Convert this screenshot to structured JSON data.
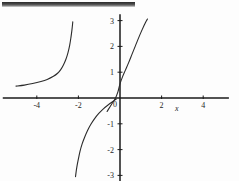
{
  "page": {
    "background_color": "#fdfdfd",
    "top_bar": {
      "label": "scan-artifact-bar",
      "color": "#2a2a2a"
    }
  },
  "chart_data": {
    "type": "line",
    "title": "",
    "subtitle": "",
    "xlabel": "x",
    "ylabel": "",
    "xlim": [
      -5.6,
      5.2
    ],
    "ylim": [
      -3.1,
      3.1
    ],
    "grid": false,
    "legend": null,
    "axis_color": "#1a1a1a",
    "curve_color": "#2b2b2b",
    "xticks": [
      -4,
      -2,
      2,
      4
    ],
    "xtick_labels": [
      "-4",
      "-2",
      "2",
      "4"
    ],
    "yticks": [
      3,
      2,
      1,
      0,
      -1,
      -2,
      -3
    ],
    "ytick_labels": [
      "3",
      "2",
      "1",
      "0",
      "-1",
      "-2",
      "-3"
    ],
    "origin_label": "0",
    "series": [
      {
        "name": "branch-left",
        "points": [
          [
            -5.0,
            0.46
          ],
          [
            -4.6,
            0.5
          ],
          [
            -4.2,
            0.56
          ],
          [
            -3.8,
            0.64
          ],
          [
            -3.5,
            0.72
          ],
          [
            -3.2,
            0.84
          ],
          [
            -3.0,
            0.96
          ],
          [
            -2.85,
            1.1
          ],
          [
            -2.72,
            1.28
          ],
          [
            -2.6,
            1.5
          ],
          [
            -2.5,
            1.76
          ],
          [
            -2.42,
            2.04
          ],
          [
            -2.36,
            2.34
          ],
          [
            -2.31,
            2.64
          ],
          [
            -2.27,
            2.95
          ]
        ]
      },
      {
        "name": "branch-middle",
        "points": [
          [
            -2.14,
            -3.05
          ],
          [
            -2.08,
            -2.7
          ],
          [
            -2.0,
            -2.36
          ],
          [
            -1.92,
            -2.06
          ],
          [
            -1.82,
            -1.78
          ],
          [
            -1.7,
            -1.52
          ],
          [
            -1.56,
            -1.26
          ],
          [
            -1.4,
            -1.02
          ],
          [
            -1.22,
            -0.8
          ],
          [
            -1.02,
            -0.6
          ],
          [
            -0.8,
            -0.42
          ],
          [
            -0.56,
            -0.26
          ],
          [
            -0.32,
            -0.12
          ],
          [
            -0.18,
            -0.04
          ]
        ]
      },
      {
        "name": "branch-right",
        "points": [
          [
            -0.62,
            -0.52
          ],
          [
            -0.42,
            -0.26
          ],
          [
            -0.24,
            -0.04
          ],
          [
            -0.1,
            0.24
          ],
          [
            0.0,
            0.55
          ],
          [
            0.12,
            0.82
          ],
          [
            0.26,
            1.08
          ],
          [
            0.42,
            1.38
          ],
          [
            0.58,
            1.7
          ],
          [
            0.74,
            2.02
          ],
          [
            0.9,
            2.34
          ],
          [
            1.06,
            2.64
          ],
          [
            1.22,
            2.92
          ],
          [
            1.32,
            3.06
          ]
        ]
      }
    ]
  }
}
